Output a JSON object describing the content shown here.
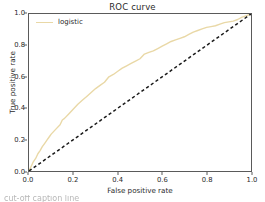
{
  "chart_data": {
    "type": "line",
    "title": "ROC curve",
    "xlabel": "False positive rate",
    "ylabel": "True positive rate",
    "xlim": [
      0.0,
      1.0
    ],
    "ylim": [
      0.0,
      1.0
    ],
    "grid": false,
    "legend_position": "upper-left",
    "xticks": [
      "0.0",
      "0.2",
      "0.4",
      "0.6",
      "0.8",
      "1.0"
    ],
    "xtick_values": [
      0.0,
      0.2,
      0.4,
      0.6,
      0.8,
      1.0
    ],
    "yticks": [
      "0.0",
      "0.2",
      "0.4",
      "0.6",
      "0.8",
      "1.0"
    ],
    "ytick_values": [
      0.0,
      0.2,
      0.4,
      0.6,
      0.8,
      1.0
    ],
    "series": [
      {
        "name": "logistic",
        "color": "#e9d8a6",
        "style": "solid",
        "x": [
          0.0,
          0.01,
          0.02,
          0.03,
          0.04,
          0.05,
          0.06,
          0.07,
          0.08,
          0.09,
          0.1,
          0.12,
          0.14,
          0.15,
          0.16,
          0.18,
          0.2,
          0.22,
          0.24,
          0.26,
          0.28,
          0.3,
          0.32,
          0.34,
          0.36,
          0.38,
          0.4,
          0.42,
          0.44,
          0.46,
          0.48,
          0.5,
          0.52,
          0.54,
          0.56,
          0.58,
          0.6,
          0.62,
          0.64,
          0.66,
          0.68,
          0.7,
          0.72,
          0.74,
          0.76,
          0.78,
          0.8,
          0.82,
          0.84,
          0.86,
          0.88,
          0.9,
          0.92,
          0.94,
          0.96,
          0.98,
          1.0
        ],
        "y": [
          0.0,
          0.03,
          0.06,
          0.08,
          0.11,
          0.13,
          0.155,
          0.175,
          0.195,
          0.215,
          0.235,
          0.265,
          0.295,
          0.325,
          0.335,
          0.365,
          0.395,
          0.425,
          0.45,
          0.475,
          0.5,
          0.525,
          0.545,
          0.565,
          0.6,
          0.615,
          0.635,
          0.655,
          0.67,
          0.685,
          0.7,
          0.715,
          0.745,
          0.755,
          0.765,
          0.78,
          0.795,
          0.81,
          0.825,
          0.835,
          0.845,
          0.855,
          0.87,
          0.885,
          0.895,
          0.905,
          0.915,
          0.92,
          0.925,
          0.935,
          0.945,
          0.95,
          0.955,
          0.965,
          0.98,
          0.99,
          1.0
        ]
      },
      {
        "name": "chance",
        "color": "#1a1a1a",
        "style": "dashed",
        "x": [
          0.0,
          1.0
        ],
        "y": [
          0.0,
          1.0
        ]
      }
    ]
  },
  "legend": {
    "entries": [
      {
        "label": "logistic",
        "color": "#e9d8a6"
      }
    ]
  },
  "caption": {
    "cutoff_text": "cut-off caption line"
  }
}
